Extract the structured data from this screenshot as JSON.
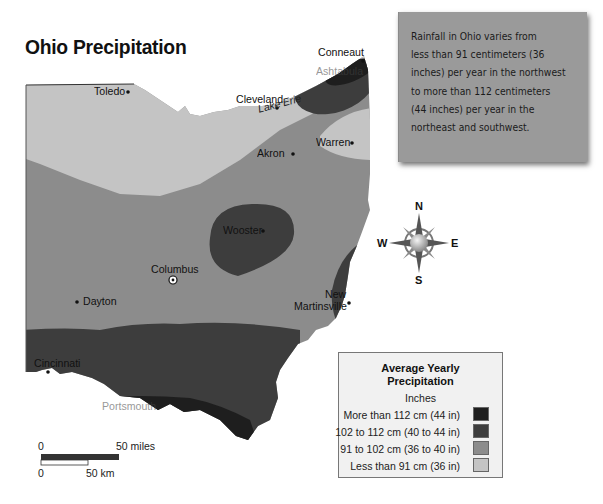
{
  "title": "Ohio Precipitation",
  "note": {
    "lines": [
      "Rainfall in Ohio varies from",
      "less than 91 centimeters (36",
      "inches) per year in the northwest",
      "to more than 112 centimeters",
      "(44 inches) per year in the",
      "northeast and southwest."
    ]
  },
  "water": {
    "lake_erie": "Lake Erie"
  },
  "cities": {
    "toledo": "Toledo",
    "cleveland": "Cleveland",
    "conneaut": "Conneaut",
    "ashtabula": "Ashtabula",
    "warren": "Warren",
    "akron": "Akron",
    "wooster": "Wooster",
    "columbus": "Columbus",
    "dayton": "Dayton",
    "new": "New",
    "martinsville": "Martinsville",
    "cincinnati": "Cincinnati",
    "portsmouth": "Portsmouth"
  },
  "compass": {
    "n": "N",
    "s": "S",
    "e": "E",
    "w": "W"
  },
  "legend": {
    "title_line1": "Average Yearly",
    "title_line2": "Precipitation",
    "subtitle": "Inches",
    "items": [
      {
        "label": "More than 112 cm (44 in)",
        "color": "#1e1e1e"
      },
      {
        "label": "102 to 112 cm (40 to 44 in)",
        "color": "#3d3d3d"
      },
      {
        "label": "91 to 102 cm (36 to 40 in)",
        "color": "#8c8c8c"
      },
      {
        "label": "Less than 91 cm (36 in)",
        "color": "#c4c4c4"
      }
    ]
  },
  "scale": {
    "miles_zero": "0",
    "miles_label": "50 miles",
    "km_zero": "0",
    "km_label": "50 km"
  },
  "colors": {
    "zone_heavy": "#1e1e1e",
    "zone_high": "#3d3d3d",
    "zone_mid": "#8c8c8c",
    "zone_low": "#c4c4c4"
  }
}
